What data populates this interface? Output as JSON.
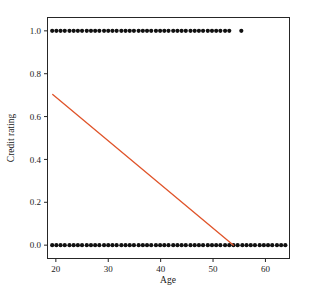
{
  "figure": {
    "background_color": "#ffffff",
    "frame_color": "#262626",
    "scan_artifact_text": "",
    "width": 310,
    "height": 300
  },
  "chart_data": {
    "type": "scatter",
    "title": "",
    "subtitle": "",
    "xlabel": "Age",
    "ylabel": "Credit rating",
    "xlim": [
      18.5,
      64.5
    ],
    "ylim": [
      -0.06,
      1.06
    ],
    "xticks": [
      20,
      30,
      40,
      50,
      60
    ],
    "xtick_labels": [
      "20",
      "30",
      "40",
      "50",
      "60"
    ],
    "yticks": [
      0.0,
      0.2,
      0.4,
      0.6,
      0.8,
      1.0
    ],
    "ytick_labels": [
      "0.0",
      "0.2",
      "0.4",
      "0.6",
      "0.8",
      "1.0"
    ],
    "grid": false,
    "legend": null,
    "marker": {
      "shape": "circle",
      "color": "#111111",
      "size_px": 3.0
    },
    "series": [
      {
        "name": "Credit rating = 1",
        "y_value": 1.0,
        "marker_color": "#111111",
        "x": [
          19.3,
          20.1,
          20.9,
          21.7,
          22.6,
          23.4,
          24.2,
          25.0,
          25.9,
          26.7,
          27.5,
          28.3,
          29.2,
          30.0,
          30.8,
          31.6,
          32.5,
          33.3,
          34.1,
          34.9,
          35.8,
          36.6,
          37.4,
          38.2,
          39.1,
          39.9,
          40.7,
          41.5,
          42.4,
          43.2,
          44.0,
          44.8,
          45.7,
          46.5,
          47.3,
          48.1,
          49.0,
          49.8,
          50.6,
          51.4,
          52.3,
          53.1,
          55.4
        ],
        "y": [
          1.0,
          1.0,
          1.0,
          1.0,
          1.0,
          1.0,
          1.0,
          1.0,
          1.0,
          1.0,
          1.0,
          1.0,
          1.0,
          1.0,
          1.0,
          1.0,
          1.0,
          1.0,
          1.0,
          1.0,
          1.0,
          1.0,
          1.0,
          1.0,
          1.0,
          1.0,
          1.0,
          1.0,
          1.0,
          1.0,
          1.0,
          1.0,
          1.0,
          1.0,
          1.0,
          1.0,
          1.0,
          1.0,
          1.0,
          1.0,
          1.0,
          1.0,
          1.0
        ]
      },
      {
        "name": "Credit rating = 0",
        "y_value": 0.0,
        "marker_color": "#111111",
        "x": [
          19.3,
          20.1,
          20.9,
          21.7,
          22.6,
          23.4,
          24.2,
          25.0,
          25.9,
          26.7,
          27.5,
          28.3,
          29.2,
          30.0,
          30.8,
          31.6,
          32.5,
          33.3,
          34.1,
          34.9,
          35.8,
          36.6,
          37.4,
          38.2,
          39.1,
          39.9,
          40.7,
          41.5,
          42.4,
          43.2,
          44.0,
          44.8,
          45.7,
          46.5,
          47.3,
          48.1,
          49.0,
          49.8,
          50.6,
          51.4,
          52.3,
          53.1,
          53.9,
          54.7,
          55.6,
          56.4,
          57.2,
          58.0,
          58.9,
          59.7,
          60.5,
          61.3,
          62.2,
          63.0,
          63.8
        ],
        "y": [
          0.0,
          0.0,
          0.0,
          0.0,
          0.0,
          0.0,
          0.0,
          0.0,
          0.0,
          0.0,
          0.0,
          0.0,
          0.0,
          0.0,
          0.0,
          0.0,
          0.0,
          0.0,
          0.0,
          0.0,
          0.0,
          0.0,
          0.0,
          0.0,
          0.0,
          0.0,
          0.0,
          0.0,
          0.0,
          0.0,
          0.0,
          0.0,
          0.0,
          0.0,
          0.0,
          0.0,
          0.0,
          0.0,
          0.0,
          0.0,
          0.0,
          0.0,
          0.0,
          0.0,
          0.0,
          0.0,
          0.0,
          0.0,
          0.0,
          0.0,
          0.0,
          0.0,
          0.0,
          0.0,
          0.0
        ]
      }
    ],
    "fit_line": {
      "name": "linear fit",
      "color": "#E0542A",
      "width_px": 1.3,
      "x_start": 19.4,
      "y_start": 0.703,
      "x_end": 53.9,
      "y_end": 0.0,
      "slope": -0.0204,
      "intercept": 1.099
    }
  }
}
